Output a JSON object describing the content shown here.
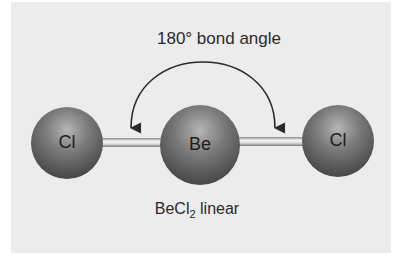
{
  "title": "180° bond angle",
  "atoms": [
    {
      "symbol": "Cl",
      "cx": 67,
      "cy": 143,
      "r": 36
    },
    {
      "symbol": "Be",
      "cx": 200,
      "cy": 145,
      "r": 40
    },
    {
      "symbol": "Cl",
      "cx": 338,
      "cy": 141,
      "r": 36
    }
  ],
  "caption": {
    "formula_main": "BeCl",
    "formula_sub": "2",
    "shape": "linear"
  },
  "colors": {
    "background": "#ececec",
    "sphere": "#6a6a6a",
    "bond": "#d8d8d8",
    "text": "#2a2a2a"
  }
}
